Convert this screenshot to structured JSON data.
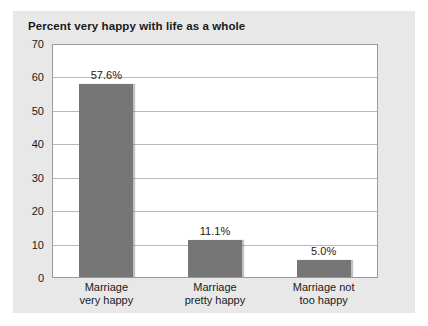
{
  "chart_data": {
    "type": "bar",
    "title": "Percent very happy with life as a whole",
    "xlabel": "",
    "ylabel": "",
    "ylim": [
      0,
      70
    ],
    "ytick_step": 10,
    "yticks": [
      "0",
      "10",
      "20",
      "30",
      "40",
      "50",
      "60",
      "70"
    ],
    "grid": true,
    "legend": false,
    "categories": [
      {
        "line1": "Marriage",
        "line2": "very happy"
      },
      {
        "line1": "Marriage",
        "line2": "pretty happy"
      },
      {
        "line1": "Marriage not",
        "line2": "too happy"
      }
    ],
    "values": [
      57.6,
      11.1,
      5.0
    ],
    "data_labels": [
      "57.6%",
      "11.1%",
      "5.0%"
    ],
    "bar_color": "#767676",
    "plot_background": "#ffffff",
    "panel_background": "#e8e8e8",
    "grid_color": "#b9b9b9",
    "text_color": "#1a1a1a"
  }
}
